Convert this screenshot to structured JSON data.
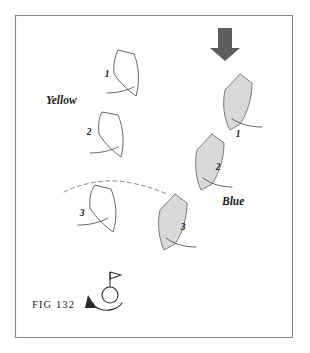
{
  "figure": {
    "caption": "FIG 132",
    "background_color": "#ffffff",
    "frame_color": "#8d8d8d"
  },
  "labels": {
    "team_yellow": "Yellow",
    "team_blue": "Blue"
  },
  "icons": {
    "wind_arrow": "down-arrow-icon",
    "mark_buoy": "buoy-mark-icon",
    "rounding_arrow": "curved-arrow-icon"
  },
  "colors": {
    "blue_boat_fill": "#d9d9d9",
    "yellow_boat_fill": "#ffffff",
    "outline": "#4b4b4b",
    "wind_arrow": "#5e5e5e",
    "dashed_path": "#7a7a7a"
  },
  "yellow_positions": [
    {
      "number": "1",
      "label_x": 107,
      "label_y": 77
    },
    {
      "number": "2",
      "label_x": 89,
      "label_y": 135
    },
    {
      "number": "3",
      "label_x": 82,
      "label_y": 216
    }
  ],
  "blue_positions": [
    {
      "number": "1",
      "label_x": 238,
      "label_y": 137
    },
    {
      "number": "2",
      "label_x": 218,
      "label_y": 170
    },
    {
      "number": "3",
      "label_x": 183,
      "label_y": 230
    }
  ],
  "annotations": {
    "yellow_team_x": 46,
    "yellow_team_y": 104,
    "blue_team_x": 222,
    "blue_team_y": 205,
    "caption_x": 32,
    "caption_y": 308
  }
}
